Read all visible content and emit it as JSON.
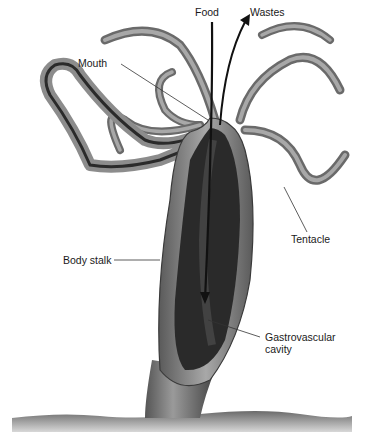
{
  "diagram": {
    "labels": {
      "food": "Food",
      "wastes": "Wastes",
      "mouth": "Mouth",
      "tentacle": "Tentacle",
      "body_stalk": "Body stalk",
      "gastro_line1": "Gastrovascular",
      "gastro_line2": "cavity"
    },
    "colors": {
      "label_text": "#1a1a1a",
      "leader_line": "#333333",
      "tentacle_fill": "#7a7a7a",
      "body_wall": "#9a9a9a",
      "cavity": "#2a2a2a",
      "substrate": "#8c8c8c"
    }
  }
}
